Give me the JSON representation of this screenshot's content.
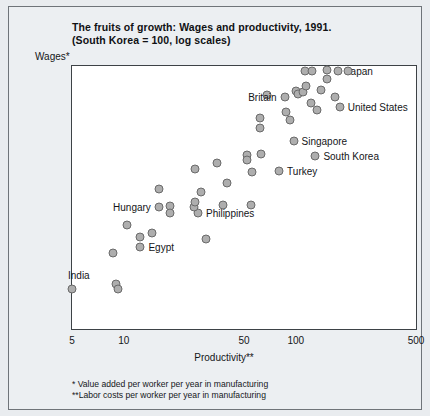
{
  "title": {
    "line1": "The fruits of growth: Wages and productivity, 1991.",
    "line2": "(South Korea = 100, log scales)"
  },
  "notes": {
    "note1": "* Value added per worker per year in manufacturing",
    "note2": "**Labor costs per worker per year in manufacturing"
  },
  "axes": {
    "y_title": "Wages*",
    "x_title": "Productivity**",
    "y_ticks": [
      "500",
      "100",
      "50",
      "10",
      "5"
    ],
    "x_ticks": [
      "5",
      "10",
      "50",
      "100",
      "500"
    ]
  },
  "colors": {
    "marker_fill": "#aeaeae",
    "marker_stroke": "#6a6a6a",
    "plot_bg": "#ffffff",
    "page_bg": "#eceff2",
    "text": "#141518"
  },
  "chart_data": {
    "type": "scatter",
    "title": "The fruits of growth: Wages and productivity, 1991. (South Korea = 100, log scales)",
    "xlabel": "Productivity**",
    "ylabel": "Wages*",
    "xscale": "log",
    "yscale": "log",
    "xlim": [
      5,
      500
    ],
    "ylim": [
      5,
      500
    ],
    "xticks": [
      5,
      10,
      50,
      100,
      500
    ],
    "yticks": [
      5,
      10,
      50,
      100,
      500
    ],
    "grid": false,
    "legend": false,
    "note": "Index values, South Korea = 100. Each marker is one country; only selected markers are annotated.",
    "points": [
      {
        "label": "India",
        "x": 5,
        "y": 10,
        "label_pos": "above"
      },
      {
        "label": "",
        "x": 9,
        "y": 11,
        "label_pos": ""
      },
      {
        "label": "",
        "x": 9.3,
        "y": 10,
        "label_pos": ""
      },
      {
        "label": "",
        "x": 8.6,
        "y": 19,
        "label_pos": ""
      },
      {
        "label": "",
        "x": 10.5,
        "y": 31,
        "label_pos": ""
      },
      {
        "label": "Egypt",
        "x": 12.5,
        "y": 21,
        "label_pos": "right"
      },
      {
        "label": "",
        "x": 12.5,
        "y": 25,
        "label_pos": ""
      },
      {
        "label": "",
        "x": 14.5,
        "y": 27,
        "label_pos": ""
      },
      {
        "label": "Hungary",
        "x": 16,
        "y": 42,
        "label_pos": "left"
      },
      {
        "label": "",
        "x": 16,
        "y": 58,
        "label_pos": ""
      },
      {
        "label": "",
        "x": 18.5,
        "y": 43,
        "label_pos": ""
      },
      {
        "label": "",
        "x": 18.5,
        "y": 38,
        "label_pos": ""
      },
      {
        "label": "Philippines",
        "x": 27,
        "y": 38,
        "label_pos": "right"
      },
      {
        "label": "",
        "x": 25.5,
        "y": 42,
        "label_pos": ""
      },
      {
        "label": "",
        "x": 26,
        "y": 46,
        "label_pos": ""
      },
      {
        "label": "",
        "x": 28,
        "y": 55,
        "label_pos": ""
      },
      {
        "label": "",
        "x": 30,
        "y": 24,
        "label_pos": ""
      },
      {
        "label": "",
        "x": 26,
        "y": 82,
        "label_pos": ""
      },
      {
        "label": "",
        "x": 35,
        "y": 92,
        "label_pos": ""
      },
      {
        "label": "",
        "x": 38,
        "y": 44,
        "label_pos": ""
      },
      {
        "label": "",
        "x": 40,
        "y": 65,
        "label_pos": ""
      },
      {
        "label": "",
        "x": 55,
        "y": 44,
        "label_pos": ""
      },
      {
        "label": "",
        "x": 52,
        "y": 105,
        "label_pos": ""
      },
      {
        "label": "",
        "x": 52,
        "y": 97,
        "label_pos": ""
      },
      {
        "label": "",
        "x": 56,
        "y": 78,
        "label_pos": ""
      },
      {
        "label": "",
        "x": 63,
        "y": 107,
        "label_pos": ""
      },
      {
        "label": "Turkey",
        "x": 80,
        "y": 79,
        "label_pos": "right"
      },
      {
        "label": "",
        "x": 62,
        "y": 200,
        "label_pos": ""
      },
      {
        "label": "",
        "x": 62,
        "y": 170,
        "label_pos": ""
      },
      {
        "label": "",
        "x": 68,
        "y": 300,
        "label_pos": ""
      },
      {
        "label": "Britain",
        "x": 86,
        "y": 290,
        "label_pos": "left"
      },
      {
        "label": "",
        "x": 88,
        "y": 225,
        "label_pos": ""
      },
      {
        "label": "",
        "x": 92,
        "y": 195,
        "label_pos": ""
      },
      {
        "label": "Singapore",
        "x": 97,
        "y": 135,
        "label_pos": "right"
      },
      {
        "label": "",
        "x": 100,
        "y": 320,
        "label_pos": ""
      },
      {
        "label": "",
        "x": 103,
        "y": 305,
        "label_pos": ""
      },
      {
        "label": "",
        "x": 110,
        "y": 315,
        "label_pos": ""
      },
      {
        "label": "",
        "x": 113,
        "y": 460,
        "label_pos": ""
      },
      {
        "label": "",
        "x": 124,
        "y": 460,
        "label_pos": ""
      },
      {
        "label": "",
        "x": 115,
        "y": 350,
        "label_pos": ""
      },
      {
        "label": "",
        "x": 122,
        "y": 260,
        "label_pos": ""
      },
      {
        "label": "South Korea",
        "x": 130,
        "y": 103,
        "label_pos": "right"
      },
      {
        "label": "",
        "x": 133,
        "y": 230,
        "label_pos": ""
      },
      {
        "label": "",
        "x": 140,
        "y": 330,
        "label_pos": ""
      },
      {
        "label": "",
        "x": 152,
        "y": 470,
        "label_pos": ""
      },
      {
        "label": "",
        "x": 152,
        "y": 400,
        "label_pos": ""
      },
      {
        "label": "Japan",
        "x": 175,
        "y": 455,
        "label_pos": "right"
      },
      {
        "label": "",
        "x": 168,
        "y": 290,
        "label_pos": ""
      },
      {
        "label": "United States",
        "x": 180,
        "y": 245,
        "label_pos": "right"
      },
      {
        "label": "",
        "x": 200,
        "y": 460,
        "label_pos": ""
      }
    ]
  }
}
